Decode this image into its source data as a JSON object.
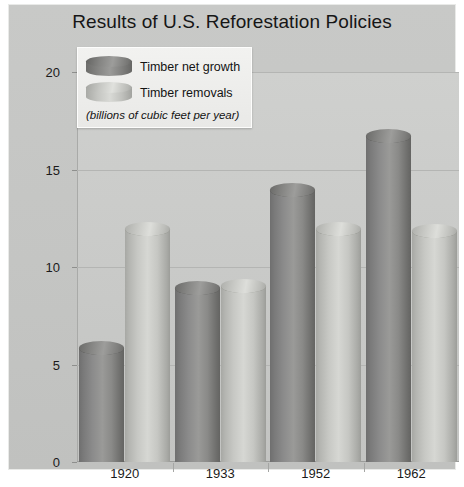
{
  "chart_data": {
    "type": "bar",
    "title": "Results of U.S. Reforestation Policies",
    "subtitle": "(billions of cubic feet per year)",
    "xlabel": "",
    "ylabel": "",
    "categories": [
      "1920",
      "1933",
      "1952",
      "1962"
    ],
    "series": [
      {
        "name": "Timber net growth",
        "values": [
          6.2,
          9.3,
          14.3,
          17.1
        ],
        "color": "#8b8b89"
      },
      {
        "name": "Timber removals",
        "values": [
          12.3,
          9.4,
          12.3,
          12.2
        ],
        "color": "#c8c9c5"
      }
    ],
    "ylim": [
      0,
      20
    ],
    "yticks": [
      0,
      5,
      10,
      15,
      20
    ],
    "ytick_labels": [
      "0",
      "5",
      "10",
      "15",
      "20"
    ],
    "grid": true,
    "legend_position": "top-left",
    "units": "billions of cubic feet per year"
  },
  "legend": {
    "items": [
      {
        "label": "Timber net growth",
        "swatch": "dark"
      },
      {
        "label": "Timber removals",
        "swatch": "light"
      }
    ],
    "note": "(billions of cubic feet per year)"
  }
}
